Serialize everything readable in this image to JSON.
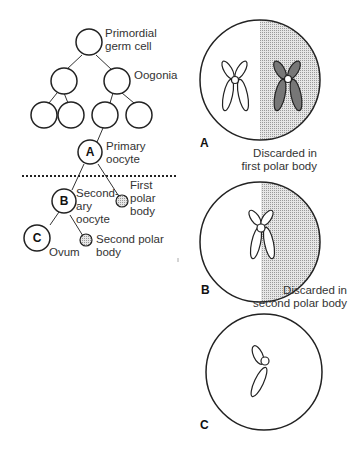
{
  "left_diagram": {
    "labels": {
      "primordial_line1": "Primordial",
      "primordial_line2": "germ cell",
      "oogonia": "Oogonia",
      "primary_line1": "Primary",
      "primary_line2": "oocyte",
      "secondary_line1": "Second-",
      "secondary_line2": "ary",
      "secondary_line3": "oocyte",
      "first_polar_line1": "First",
      "first_polar_line2": "polar",
      "first_polar_line3": "body",
      "second_polar_line1": "Second polar",
      "second_polar_line2": "body",
      "ovum": "Ovum"
    },
    "node_letters": {
      "a": "A",
      "b": "B",
      "c": "C"
    }
  },
  "right_diagram": {
    "panels": [
      {
        "letter": "A",
        "caption_line1": "Discarded in",
        "caption_line2": "first polar body"
      },
      {
        "letter": "B",
        "caption_line1": "Discarded in",
        "caption_line2": "second polar body"
      },
      {
        "letter": "C"
      }
    ]
  },
  "colors": {
    "shade": "#cfcfcf",
    "stroke": "#222222"
  }
}
